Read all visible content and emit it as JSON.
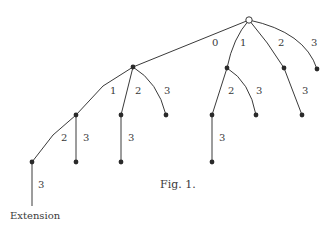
{
  "figure": {
    "caption": "Fig. 1.",
    "extension_label": "Extension",
    "colors": {
      "ink": "#3a3a3a",
      "background": "#ffffff"
    }
  },
  "tree": {
    "root": {
      "id": "r",
      "x": 249,
      "y": 20,
      "open": true
    },
    "nodes": [
      {
        "id": "a",
        "x": 133,
        "y": 67
      },
      {
        "id": "b",
        "x": 227,
        "y": 68
      },
      {
        "id": "c",
        "x": 284,
        "y": 68
      },
      {
        "id": "d",
        "x": 317,
        "y": 69
      },
      {
        "id": "a1",
        "x": 76,
        "y": 115
      },
      {
        "id": "a2",
        "x": 121,
        "y": 115
      },
      {
        "id": "a3",
        "x": 166,
        "y": 115
      },
      {
        "id": "b2",
        "x": 212,
        "y": 115
      },
      {
        "id": "b3",
        "x": 256,
        "y": 115
      },
      {
        "id": "c3",
        "x": 302,
        "y": 115
      },
      {
        "id": "a12",
        "x": 32,
        "y": 162
      },
      {
        "id": "a13",
        "x": 76,
        "y": 162
      },
      {
        "id": "a23",
        "x": 121,
        "y": 162
      },
      {
        "id": "b23",
        "x": 212,
        "y": 162
      }
    ],
    "edges": [
      {
        "from": "r",
        "to": "a",
        "label": "0",
        "lx": 212,
        "ly": 46
      },
      {
        "from": "r",
        "to": "b",
        "label": "1",
        "lx": 240,
        "ly": 46
      },
      {
        "from": "r",
        "to": "c",
        "label": "2",
        "lx": 278,
        "ly": 46
      },
      {
        "from": "r",
        "to": "d",
        "label": "3",
        "lx": 311,
        "ly": 46
      },
      {
        "from": "a",
        "to": "a1",
        "label": "1",
        "lx": 110,
        "ly": 94
      },
      {
        "from": "a",
        "to": "a2",
        "label": "2",
        "lx": 135,
        "ly": 94
      },
      {
        "from": "a",
        "to": "a3",
        "label": "3",
        "lx": 164,
        "ly": 94
      },
      {
        "from": "b",
        "to": "b2",
        "label": "2",
        "lx": 228,
        "ly": 94
      },
      {
        "from": "b",
        "to": "b3",
        "label": "3",
        "lx": 256,
        "ly": 94
      },
      {
        "from": "c",
        "to": "c3",
        "label": "3",
        "lx": 302,
        "ly": 94
      },
      {
        "from": "a1",
        "to": "a12",
        "label": "2",
        "lx": 61,
        "ly": 141
      },
      {
        "from": "a1",
        "to": "a13",
        "label": "3",
        "lx": 83,
        "ly": 141
      },
      {
        "from": "a2",
        "to": "a23",
        "label": "3",
        "lx": 128,
        "ly": 141
      },
      {
        "from": "b2",
        "to": "b23",
        "label": "3",
        "lx": 219,
        "ly": 141
      },
      {
        "from": "a12",
        "to": "ext",
        "label": "3",
        "lx": 38,
        "ly": 188
      }
    ]
  }
}
